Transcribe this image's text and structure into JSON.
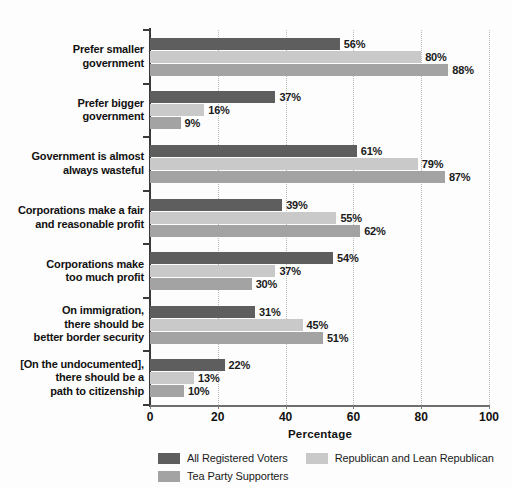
{
  "chart_data": {
    "type": "bar",
    "orientation": "horizontal",
    "title": "",
    "xlabel": "Percentage",
    "ylabel": "",
    "xlim": [
      0,
      100
    ],
    "xticks": [
      0,
      20,
      40,
      60,
      80,
      100
    ],
    "grid": true,
    "legend_position": "bottom",
    "value_suffix": "%",
    "categories": [
      "Prefer smaller\ngovernment",
      "Prefer bigger\ngovernment",
      "Government is almost\nalways wasteful",
      "Corporations make a fair\nand reasonable profit",
      "Corporations make\ntoo much profit",
      "On immigration,\nthere should be\nbetter border security",
      "[On the undocumented],\nthere should be a\npath to citizenship"
    ],
    "category_lines": [
      [
        "Prefer smaller",
        "government"
      ],
      [
        "Prefer bigger",
        "government"
      ],
      [
        "Government is almost",
        "always wasteful"
      ],
      [
        "Corporations make a fair",
        "and reasonable profit"
      ],
      [
        "Corporations make",
        "too much profit"
      ],
      [
        "On immigration,",
        "there should be",
        "better border security"
      ],
      [
        "[On the undocumented],",
        "there should be a",
        "path to citizenship"
      ]
    ],
    "series": [
      {
        "name": "All Registered Voters",
        "color": "#5e5e5e",
        "values": [
          56,
          37,
          61,
          39,
          54,
          31,
          22
        ],
        "labels": [
          "56%",
          "37%",
          "61%",
          "39%",
          "54%",
          "31%",
          "22%"
        ]
      },
      {
        "name": "Republican and Lean Republican",
        "color": "#c9c9c9",
        "values": [
          80,
          16,
          79,
          55,
          37,
          45,
          13
        ],
        "labels": [
          "80%",
          "16%",
          "79%",
          "55%",
          "37%",
          "45%",
          "13%"
        ]
      },
      {
        "name": "Tea Party Supporters",
        "color": "#a3a3a3",
        "values": [
          88,
          9,
          87,
          62,
          30,
          51,
          10
        ],
        "labels": [
          "88%",
          "9%",
          "87%",
          "62%",
          "30%",
          "51%",
          "10%"
        ]
      }
    ],
    "xtick_labels": [
      "0",
      "20",
      "40",
      "60",
      "80",
      "100"
    ]
  },
  "legend": {
    "items": [
      {
        "label": "All Registered Voters",
        "color": "#5e5e5e"
      },
      {
        "label": "Republican and Lean Republican",
        "color": "#c9c9c9"
      },
      {
        "label": "Tea Party Supporters",
        "color": "#a3a3a3"
      }
    ]
  },
  "axis": {
    "title": "Percentage"
  }
}
